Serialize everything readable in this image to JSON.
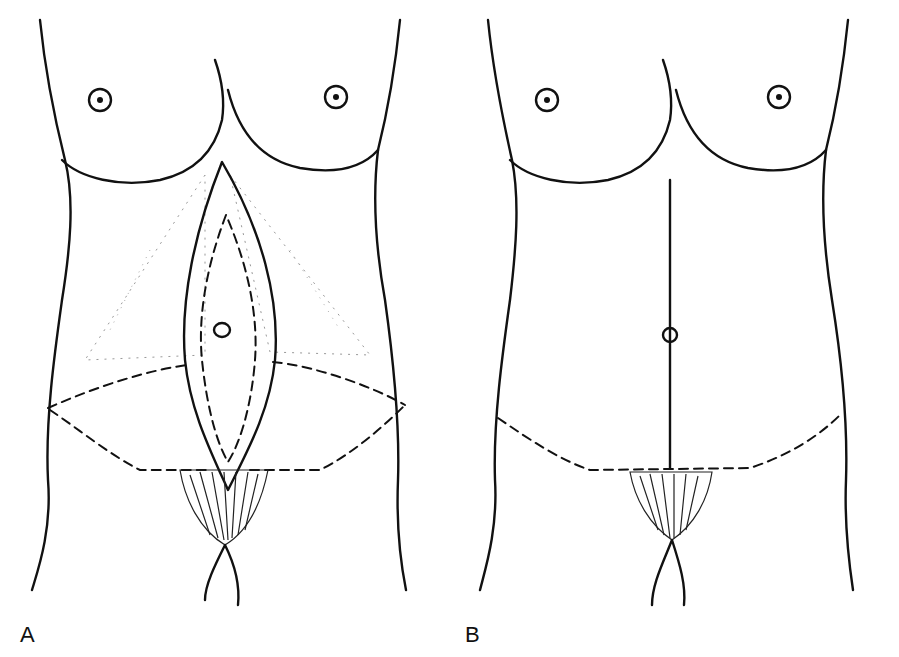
{
  "figure": {
    "panels": [
      {
        "label": "A",
        "description": "Preoperative markings: vertical elliptical excision around umbilicus, transverse lower incision, stippled undermining area"
      },
      {
        "label": "B",
        "description": "Postoperative result: vertical midline scar with relocated umbilicus and transverse lower scar"
      }
    ]
  }
}
